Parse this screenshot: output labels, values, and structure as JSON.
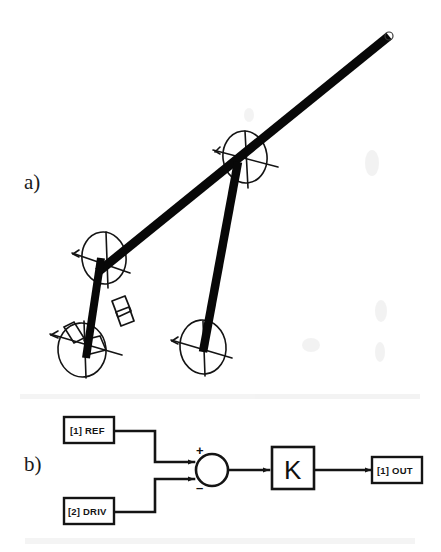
{
  "figure": {
    "panels": [
      {
        "key": "a",
        "label": "a)",
        "caption_omitted": true
      },
      {
        "key": "b",
        "label": "b)",
        "caption_omitted": true
      }
    ]
  },
  "panel_a": {
    "label": "a)",
    "description_type": "kinematic-linkage-sketch",
    "elements": {
      "long_arm": "thick-diagonal-beam",
      "strut": "thick-vertical-beam",
      "lower_post": "thick-short-beam",
      "joints": [
        "joint-upper",
        "joint-mid",
        "joint-lower-left",
        "joint-lower-right"
      ],
      "bracket": "small-rect-fixture"
    }
  },
  "panel_b": {
    "label": "b)",
    "blocks": [
      {
        "id": "ref",
        "name": "input-ref-block",
        "text": "[1] REF"
      },
      {
        "id": "driv",
        "name": "input-driv-block",
        "text": "[2] DRIV"
      },
      {
        "id": "gain",
        "name": "gain-block",
        "text": "K"
      },
      {
        "id": "out",
        "name": "output-block",
        "text": "[1] OUT"
      }
    ],
    "summing_junction": {
      "name": "summing-junction",
      "plus_sign": "+",
      "minus_sign": "–"
    },
    "signals": [
      {
        "from": "ref",
        "to": "summing-junction-plus"
      },
      {
        "from": "driv",
        "to": "summing-junction-minus"
      },
      {
        "from": "summing-junction",
        "to": "gain"
      },
      {
        "from": "gain",
        "to": "out"
      }
    ]
  },
  "colors": {
    "background": "#ffffff",
    "ink": "#101010",
    "line": "#1c1c1c"
  }
}
